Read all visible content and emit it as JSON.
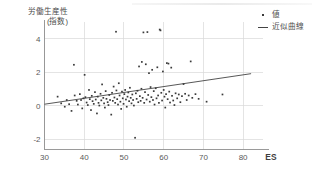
{
  "chart_data": {
    "type": "scatter",
    "title": "",
    "subtitle": "",
    "xlabel": "ES",
    "ylabel": "労働生産性\n(指数)",
    "ylabel_line1": "労働生産性",
    "ylabel_line2": "(指数)",
    "xlim": [
      30,
      85
    ],
    "ylim": [
      -2.6,
      5.0
    ],
    "xticks": [
      30,
      40,
      50,
      60,
      70,
      80
    ],
    "yticks": [
      -2,
      0,
      2,
      4
    ],
    "xtick_labels": [
      "30",
      "40",
      "50",
      "60",
      "70",
      "80"
    ],
    "ytick_labels": [
      "-2",
      "0",
      "2",
      "4"
    ],
    "grid": true,
    "grid_color": "#d9d9d9",
    "axis_color": "#8f8f8f",
    "marker_color": "#3a3a3a",
    "line_color": "#444444",
    "legend_position": "top-right",
    "legend": [
      {
        "label": "値",
        "marker": "dot"
      },
      {
        "label": "近似曲線",
        "marker": "line"
      }
    ],
    "series": [
      {
        "name": "値",
        "type": "scatter",
        "points": [
          [
            33.3,
            0.55
          ],
          [
            34.2,
            0.15
          ],
          [
            35.1,
            -0.05
          ],
          [
            35.6,
            0.35
          ],
          [
            36.2,
            0.1
          ],
          [
            36.8,
            -0.3
          ],
          [
            37.4,
            2.45
          ],
          [
            37.6,
            0.62
          ],
          [
            38.1,
            0.3
          ],
          [
            38.4,
            0.08
          ],
          [
            38.9,
            0.7
          ],
          [
            39.2,
            0.35
          ],
          [
            39.5,
            -0.15
          ],
          [
            39.8,
            0.45
          ],
          [
            40.1,
            1.85
          ],
          [
            40.3,
            0.52
          ],
          [
            40.6,
            0.2
          ],
          [
            40.9,
            0.05
          ],
          [
            41.2,
            0.95
          ],
          [
            41.4,
            0.4
          ],
          [
            41.7,
            -0.25
          ],
          [
            41.9,
            0.6
          ],
          [
            42.1,
            0.28
          ],
          [
            42.4,
            0.12
          ],
          [
            42.7,
            0.82
          ],
          [
            42.9,
            0.38
          ],
          [
            43.2,
            -0.45
          ],
          [
            43.4,
            0.55
          ],
          [
            43.6,
            0.18
          ],
          [
            43.8,
            0.02
          ],
          [
            44.1,
            0.72
          ],
          [
            44.3,
            0.33
          ],
          [
            44.5,
            1.28
          ],
          [
            44.8,
            0.48
          ],
          [
            45.0,
            0.15
          ],
          [
            45.2,
            -0.1
          ],
          [
            45.4,
            0.88
          ],
          [
            45.6,
            0.42
          ],
          [
            45.9,
            0.22
          ],
          [
            46.1,
            0.05
          ],
          [
            46.3,
            0.65
          ],
          [
            46.5,
            0.35
          ],
          [
            46.8,
            -0.52
          ],
          [
            47.0,
            0.78
          ],
          [
            47.2,
            0.3
          ],
          [
            47.4,
            1.15
          ],
          [
            47.6,
            0.5
          ],
          [
            47.8,
            0.18
          ],
          [
            48.0,
            4.42
          ],
          [
            48.1,
            0.92
          ],
          [
            48.3,
            0.4
          ],
          [
            48.5,
            0.08
          ],
          [
            48.7,
            1.35
          ],
          [
            48.9,
            0.62
          ],
          [
            49.1,
            0.25
          ],
          [
            49.3,
            -0.18
          ],
          [
            49.5,
            0.85
          ],
          [
            49.7,
            0.45
          ],
          [
            49.9,
            0.12
          ],
          [
            50.1,
            0.7
          ],
          [
            50.3,
            0.95
          ],
          [
            50.5,
            0.38
          ],
          [
            50.7,
            -0.05
          ],
          [
            50.9,
            0.55
          ],
          [
            51.1,
            0.8
          ],
          [
            51.3,
            0.28
          ],
          [
            51.5,
            1.08
          ],
          [
            51.7,
            0.48
          ],
          [
            51.9,
            0.15
          ],
          [
            52.1,
            0.68
          ],
          [
            52.3,
            0.35
          ],
          [
            52.5,
            0.02
          ],
          [
            52.8,
            -1.9
          ],
          [
            53.0,
            0.75
          ],
          [
            53.2,
            0.42
          ],
          [
            53.4,
            0.9
          ],
          [
            53.6,
            0.22
          ],
          [
            53.8,
            2.35
          ],
          [
            54.0,
            0.58
          ],
          [
            54.2,
            0.3
          ],
          [
            54.4,
            1.02
          ],
          [
            54.5,
            2.62
          ],
          [
            54.7,
            0.48
          ],
          [
            54.9,
            4.38
          ],
          [
            55.1,
            0.18
          ],
          [
            55.3,
            0.82
          ],
          [
            55.5,
            2.48
          ],
          [
            55.7,
            0.38
          ],
          [
            55.9,
            4.4
          ],
          [
            56.1,
            0.65
          ],
          [
            56.3,
            1.95
          ],
          [
            56.5,
            0.25
          ],
          [
            56.7,
            1.12
          ],
          [
            56.9,
            0.52
          ],
          [
            57.1,
            2.15
          ],
          [
            57.3,
            0.35
          ],
          [
            57.5,
            0.88
          ],
          [
            57.7,
            0.08
          ],
          [
            58.0,
            1.05
          ],
          [
            58.2,
            0.45
          ],
          [
            58.4,
            2.3
          ],
          [
            58.6,
            0.62
          ],
          [
            58.8,
            0.18
          ],
          [
            59.0,
            4.55
          ],
          [
            59.2,
            4.5
          ],
          [
            59.4,
            0.78
          ],
          [
            59.6,
            0.32
          ],
          [
            59.8,
            2.05
          ],
          [
            60.0,
            0.95
          ],
          [
            60.2,
            0.55
          ],
          [
            60.4,
            -0.1
          ],
          [
            60.6,
            0.7
          ],
          [
            60.8,
            2.55
          ],
          [
            61.0,
            0.4
          ],
          [
            61.2,
            2.52
          ],
          [
            61.4,
            0.85
          ],
          [
            61.6,
            0.2
          ],
          [
            61.9,
            2.28
          ],
          [
            62.1,
            0.6
          ],
          [
            62.4,
            0.32
          ],
          [
            62.7,
            0.05
          ],
          [
            63.0,
            0.75
          ],
          [
            63.4,
            0.45
          ],
          [
            63.8,
            0.68
          ],
          [
            64.2,
            0.22
          ],
          [
            64.6,
            0.58
          ],
          [
            65.0,
            1.3
          ],
          [
            65.4,
            0.72
          ],
          [
            65.8,
            0.35
          ],
          [
            66.3,
            0.62
          ],
          [
            66.8,
            2.65
          ],
          [
            67.2,
            0.48
          ],
          [
            68.0,
            0.7
          ],
          [
            68.8,
            0.42
          ],
          [
            70.8,
            0.25
          ],
          [
            74.8,
            0.68
          ]
        ]
      },
      {
        "name": "近似曲線",
        "type": "line",
        "endpoints": [
          [
            30,
            0.1
          ],
          [
            82,
            1.92
          ]
        ],
        "slope": 0.035,
        "intercept": -0.95
      }
    ]
  },
  "axes": {
    "x_title": "ES"
  }
}
